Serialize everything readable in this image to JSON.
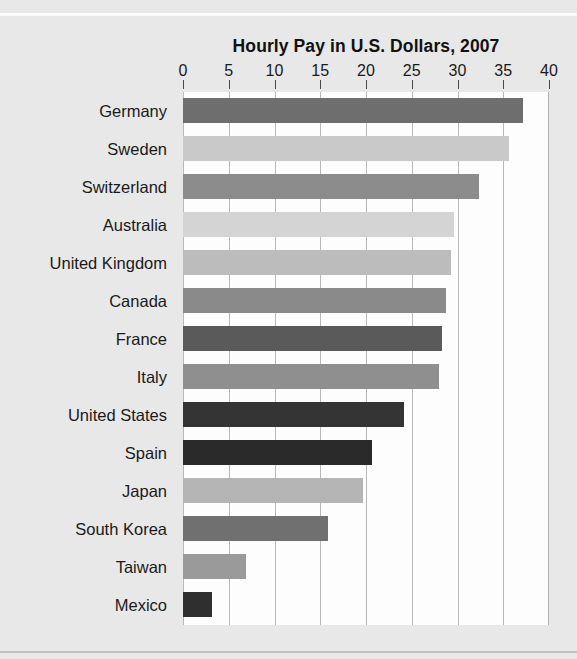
{
  "chart_data": {
    "type": "bar",
    "orientation": "horizontal",
    "title": "Hourly Pay in U.S. Dollars, 2007",
    "xlabel": "",
    "ylabel": "",
    "xlim": [
      0,
      40
    ],
    "xticks": [
      0,
      5,
      10,
      15,
      20,
      25,
      30,
      35,
      40
    ],
    "grid": true,
    "legend": "none",
    "categories": [
      "Germany",
      "Sweden",
      "Switzerland",
      "Australia",
      "United Kingdom",
      "Canada",
      "France",
      "Italy",
      "United States",
      "Spain",
      "Japan",
      "South Korea",
      "Taiwan",
      "Mexico"
    ],
    "values": [
      37.2,
      35.6,
      32.3,
      29.6,
      29.3,
      28.7,
      28.3,
      28.0,
      24.1,
      20.7,
      19.7,
      15.8,
      6.9,
      3.2
    ],
    "bar_colors": [
      "#6e6e6e",
      "#c9c9c9",
      "#8c8c8c",
      "#d4d4d4",
      "#bcbcbc",
      "#8a8a8a",
      "#5a5a5a",
      "#8f8f8f",
      "#343434",
      "#2a2a2a",
      "#b5b5b5",
      "#707070",
      "#9a9a9a",
      "#2f2f2f"
    ]
  },
  "colors": {
    "page_background": "#e8e8e8",
    "plot_background": "#fdfdfd",
    "gridline": "#b9b9b9",
    "text": "#1a1a1a",
    "title": "#111111"
  }
}
